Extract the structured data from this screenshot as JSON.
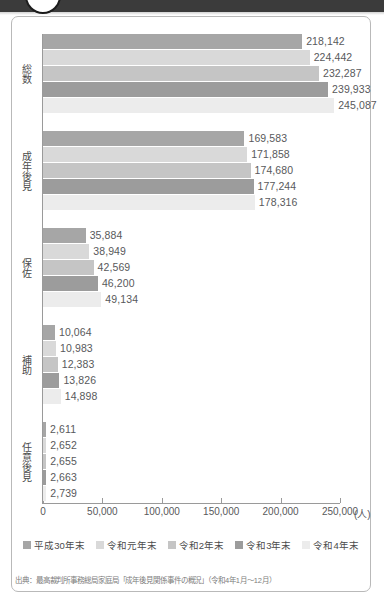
{
  "header": {
    "circle_icon": "circle-outline"
  },
  "chart_data": {
    "type": "bar",
    "orientation": "horizontal",
    "title": "",
    "xlabel": "(人)",
    "ylabel": "",
    "xlim": [
      0,
      250000
    ],
    "xticks": [
      0,
      50000,
      100000,
      150000,
      200000,
      250000
    ],
    "xtick_labels": [
      "0",
      "50,000",
      "100,000",
      "150,000",
      "200,000",
      "250,000"
    ],
    "x_unit_label": "(人)",
    "grid": false,
    "legend_position": "bottom",
    "categories": [
      "総数",
      "成年後見",
      "保佐",
      "補助",
      "任意後見"
    ],
    "series": [
      {
        "name": "平成30年末",
        "color": "#a6a6a6",
        "values": [
          218142,
          169583,
          35884,
          10064,
          2611
        ],
        "labels": [
          "218,142",
          "169,583",
          "35,884",
          "10,064",
          "2,611"
        ]
      },
      {
        "name": "令和元年末",
        "color": "#d9d9d9",
        "values": [
          224442,
          171858,
          38949,
          10983,
          2652
        ],
        "labels": [
          "224,442",
          "171,858",
          "38,949",
          "10,983",
          "2,652"
        ]
      },
      {
        "name": "令和2年末",
        "color": "#c5c5c5",
        "values": [
          232287,
          174680,
          42569,
          12383,
          2655
        ],
        "labels": [
          "232,287",
          "174,680",
          "42,569",
          "12,383",
          "2,655"
        ]
      },
      {
        "name": "令和3年末",
        "color": "#9c9c9c",
        "values": [
          239933,
          177244,
          46200,
          13826,
          2663
        ],
        "labels": [
          "239,933",
          "177,244",
          "46,200",
          "13,826",
          "2,663"
        ]
      },
      {
        "name": "令和4年末",
        "color": "#ececec",
        "values": [
          245087,
          178316,
          49134,
          14898,
          2739
        ],
        "labels": [
          "245,087",
          "178,316",
          "49,134",
          "14,898",
          "2,739"
        ]
      }
    ]
  },
  "source": {
    "text": "出典：最高裁判所事務総局家庭局「成年後見関係事件の概況」（令和4年1月～12月）"
  }
}
